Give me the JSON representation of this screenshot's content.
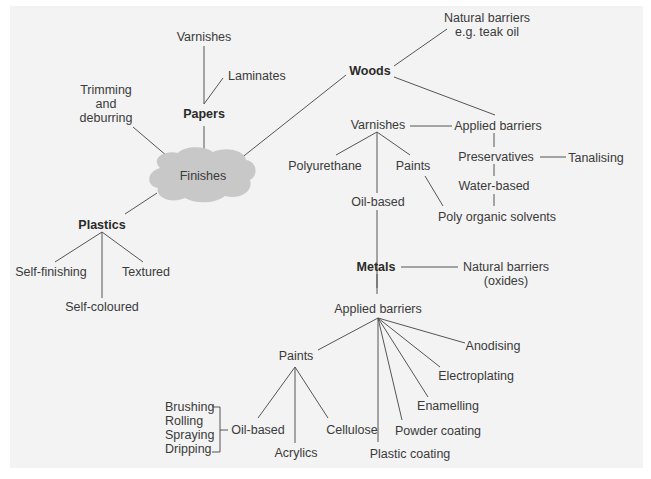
{
  "diagram": {
    "title": "Finishes",
    "nodes": {
      "finishes": "Finishes",
      "papers": "Papers",
      "papers_varnishes": "Varnishes",
      "laminates": "Laminates",
      "trimming": [
        "Trimming",
        "and",
        "deburring"
      ],
      "plastics": "Plastics",
      "self_finishing": "Self-finishing",
      "textured": "Textured",
      "self_coloured": "Self-coloured",
      "woods": "Woods",
      "woods_natural": [
        "Natural barriers",
        "e.g. teak oil"
      ],
      "woods_varnishes": "Varnishes",
      "woods_applied": "Applied barriers",
      "polyurethane": "Polyurethane",
      "woods_paints": "Paints",
      "woods_oil_based": "Oil-based",
      "preservatives": "Preservatives",
      "tanalising": "Tanalising",
      "water_based": "Water-based",
      "poly_organic": "Poly organic solvents",
      "metals": "Metals",
      "metals_natural": [
        "Natural barriers",
        "(oxides)"
      ],
      "metals_applied": "Applied barriers",
      "metals_paints": "Paints",
      "anodising": "Anodising",
      "electroplating": "Electroplating",
      "enamelling": "Enamelling",
      "powder_coating": "Powder coating",
      "plastic_coating": "Plastic coating",
      "paints_oil_based": "Oil-based",
      "acrylics": "Acrylics",
      "cellulose": "Cellulose",
      "methods": [
        "Brushing",
        "Rolling",
        "Spraying",
        "Dripping"
      ]
    }
  }
}
